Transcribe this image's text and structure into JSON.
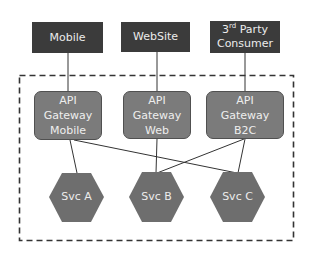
{
  "diagram": {
    "clients": [
      {
        "id": "mobile",
        "label": "Mobile"
      },
      {
        "id": "website",
        "label": "WebSite"
      },
      {
        "id": "third-party",
        "label_prefix": "3",
        "label_sup": "rd",
        "label_rest": " Party",
        "label_line2": "Consumer"
      }
    ],
    "gateways": [
      {
        "id": "gw-mobile",
        "lines": [
          "API",
          "Gateway",
          "Mobile"
        ]
      },
      {
        "id": "gw-web",
        "lines": [
          "API",
          "Gateway",
          "Web"
        ]
      },
      {
        "id": "gw-b2c",
        "lines": [
          "API",
          "Gateway",
          "B2C"
        ]
      }
    ],
    "services": [
      {
        "id": "svc-a",
        "label": "Svc A"
      },
      {
        "id": "svc-b",
        "label": "Svc B"
      },
      {
        "id": "svc-c",
        "label": "Svc C"
      }
    ],
    "connections": [
      [
        "mobile",
        "gw-mobile"
      ],
      [
        "website",
        "gw-web"
      ],
      [
        "third-party",
        "gw-b2c"
      ],
      [
        "gw-mobile",
        "svc-a"
      ],
      [
        "gw-mobile",
        "svc-c"
      ],
      [
        "gw-web",
        "svc-b"
      ],
      [
        "gw-b2c",
        "svc-b"
      ],
      [
        "gw-b2c",
        "svc-c"
      ]
    ],
    "colors": {
      "client_fill": "#3b3b3b",
      "gateway_fill": "#7b7b7b",
      "service_fill": "#6e6e6e",
      "line": "#333333",
      "boundary": "#333333"
    }
  }
}
